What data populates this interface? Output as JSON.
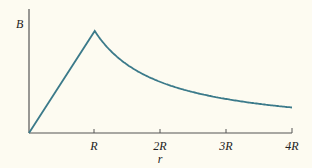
{
  "chart_data": {
    "type": "line",
    "title": "",
    "xlabel": "r",
    "ylabel": "B",
    "x_ticks": [
      "R",
      "2R",
      "3R",
      "4R"
    ],
    "x": [
      0,
      1,
      1.25,
      1.5,
      2,
      2.5,
      3,
      3.5,
      4
    ],
    "series": [
      {
        "name": "B(r)",
        "values": [
          0,
          1,
          0.8,
          0.667,
          0.5,
          0.4,
          0.333,
          0.286,
          0.25
        ]
      }
    ],
    "xlim": [
      0,
      4
    ],
    "ylim": [
      0,
      1.2
    ],
    "grid": false,
    "legend": "none",
    "colors": {
      "curve": "#3b7a8a",
      "axis": "#555555"
    }
  },
  "labels": {
    "y_axis": "B",
    "x_axis": "r",
    "ticks": [
      "R",
      "2R",
      "3R",
      "4R"
    ]
  }
}
